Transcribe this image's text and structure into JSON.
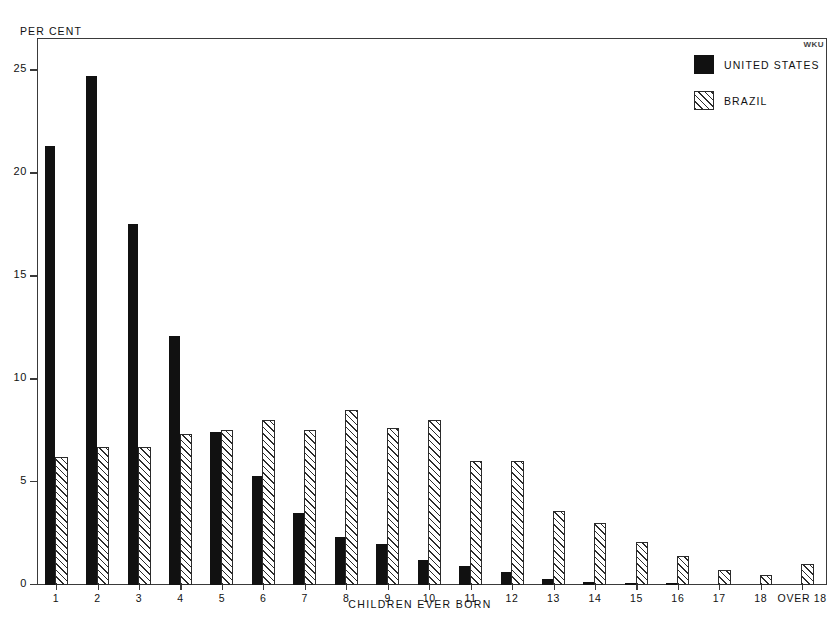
{
  "watermark": "WKU",
  "legend": {
    "entries": [
      {
        "label": "UNITED STATES",
        "style": "solid",
        "color": "#111111"
      },
      {
        "label": "BRAZIL",
        "style": "hatched",
        "color": "#2b2b2b"
      }
    ]
  },
  "axis": {
    "y_caption": "PER CENT",
    "x_caption": "CHILDREN EVER BORN"
  },
  "chart_data": {
    "type": "bar",
    "title": "",
    "xlabel": "CHILDREN EVER BORN",
    "ylabel": "PER CENT",
    "ylim": [
      0,
      26.5
    ],
    "yticks": [
      0,
      5,
      10,
      15,
      20,
      25
    ],
    "ytick_labels": [
      "0",
      "5",
      "10",
      "15",
      "20",
      "25"
    ],
    "grid": false,
    "legend_position": "top-right",
    "categories": [
      "1",
      "2",
      "3",
      "4",
      "5",
      "6",
      "7",
      "8",
      "9",
      "10",
      "11",
      "12",
      "13",
      "14",
      "15",
      "16",
      "17",
      "18",
      "OVER 18"
    ],
    "series": [
      {
        "name": "UNITED STATES",
        "color": "#111111",
        "values": [
          21.3,
          24.7,
          17.5,
          12.1,
          7.4,
          5.3,
          3.5,
          2.3,
          2.0,
          1.2,
          0.9,
          0.6,
          0.3,
          0.15,
          0.1,
          0.05,
          0,
          0,
          0
        ]
      },
      {
        "name": "BRAZIL",
        "color": "#2b2b2b",
        "values": [
          6.2,
          6.7,
          6.7,
          7.3,
          7.5,
          8.0,
          7.5,
          8.5,
          7.6,
          8.0,
          6.0,
          6.0,
          3.6,
          3.0,
          2.1,
          1.4,
          0.7,
          0.5,
          1.0
        ]
      }
    ]
  }
}
